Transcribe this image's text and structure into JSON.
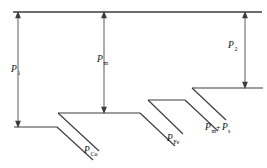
{
  "diagram": {
    "type": "power-flow-sankey-staircase",
    "stroke_color": "#3c3c3c",
    "background_color": "#ffffff",
    "labels": {
      "input_power": {
        "base": "P",
        "subscript": "1"
      },
      "mechanical_power": {
        "base": "P",
        "subscript": "m"
      },
      "output_power": {
        "base": "P",
        "subscript": "2"
      },
      "copper_loss": {
        "base": "P",
        "subscript": "Cu"
      },
      "iron_loss": {
        "base": "P",
        "subscript": "Fe"
      },
      "mech_stray_loss": {
        "base1": "P",
        "sub1": "m",
        "operator": "+",
        "base2": "P",
        "sub2": "s"
      }
    },
    "dimension_arrows": [
      {
        "name": "P1",
        "x": 18,
        "top": 12,
        "bottom": 127,
        "double_headed": true
      },
      {
        "name": "Pm",
        "x": 104,
        "top": 12,
        "bottom": 113,
        "double_headed": true
      },
      {
        "name": "P2",
        "x": 245,
        "top": 12,
        "bottom": 88,
        "double_headed": true
      }
    ],
    "ledges": [
      {
        "name": "level-1",
        "y": 127,
        "x1": 14,
        "x2": 57
      },
      {
        "name": "level-2",
        "y": 113,
        "x1": 58,
        "x2": 140
      },
      {
        "name": "level-3",
        "y": 100,
        "x1": 148,
        "x2": 185
      },
      {
        "name": "level-4",
        "y": 88,
        "x1": 192,
        "x2": 263
      }
    ],
    "top_rail": {
      "y": 12,
      "x1": 13,
      "x2": 262
    }
  }
}
